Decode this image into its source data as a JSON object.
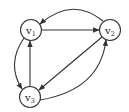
{
  "diagram": {
    "type": "directed-graph",
    "colors": {
      "stroke": "#333333",
      "node_fill": "#ffffff",
      "text": "#222222"
    },
    "nodes": [
      {
        "id": "v1",
        "base": "v",
        "sub": "1",
        "x": 31,
        "y": 30
      },
      {
        "id": "v2",
        "base": "v",
        "sub": "2",
        "x": 110,
        "y": 30
      },
      {
        "id": "v3",
        "base": "v",
        "sub": "3",
        "x": 30,
        "y": 97
      }
    ],
    "edges": [
      {
        "from": "v1",
        "to": "v2",
        "style": "straight"
      },
      {
        "from": "v2",
        "to": "v1",
        "style": "curved"
      },
      {
        "from": "v2",
        "to": "v3",
        "style": "straight"
      },
      {
        "from": "v3",
        "to": "v2",
        "style": "curved"
      },
      {
        "from": "v3",
        "to": "v1",
        "style": "straight"
      },
      {
        "from": "v1",
        "to": "v3",
        "style": "curved"
      }
    ]
  }
}
